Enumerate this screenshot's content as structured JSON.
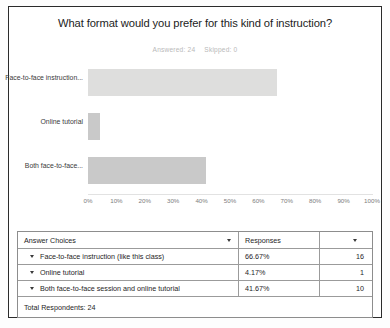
{
  "chart_data": {
    "type": "bar",
    "orientation": "horizontal",
    "title": "What format would you prefer for this kind of instruction?",
    "subtitle_answered_label": "Answered: 24",
    "subtitle_skipped_label": "Skipped: 0",
    "categories": [
      "Face-to-face instruction...",
      "Online tutorial",
      "Both face-to-face..."
    ],
    "values": [
      66.67,
      4.17,
      41.67
    ],
    "counts": [
      16,
      1,
      10
    ],
    "xlabel": "",
    "ylabel": "",
    "xlim": [
      0,
      100
    ],
    "tick_labels": [
      "0%",
      "10%",
      "20%",
      "30%",
      "40%",
      "50%",
      "60%",
      "70%",
      "80%",
      "90%",
      "100%"
    ],
    "grid": false,
    "legend": "none",
    "bar_colors": [
      "#dededd",
      "#c9c9c9",
      "#c9c9c9"
    ]
  },
  "table": {
    "headers": {
      "choices": "Answer Choices",
      "responses": "Responses",
      "count": ""
    },
    "rows": [
      {
        "choice": "Face-to-face instruction (like this class)",
        "percent": "66.67%",
        "count": "16"
      },
      {
        "choice": "Online tutorial",
        "percent": "4.17%",
        "count": "1"
      },
      {
        "choice": "Both face-to-face session and online tutorial",
        "percent": "41.67%",
        "count": "10"
      }
    ],
    "total": "Total Respondents: 24"
  }
}
